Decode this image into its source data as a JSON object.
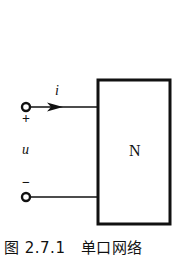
{
  "figure": {
    "caption": "图 2.7.1　单口网络",
    "network_label": "N",
    "current_label": "i",
    "voltage_label": "u",
    "plus_sign": "+",
    "minus_sign": "−"
  },
  "colors": {
    "stroke": "#111111",
    "background": "#ffffff"
  }
}
